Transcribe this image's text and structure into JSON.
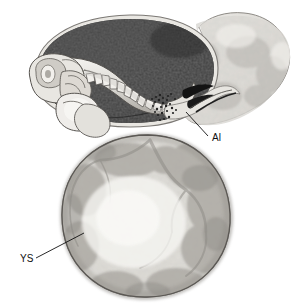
{
  "figure": {
    "kind": "anatomical-illustration",
    "background_color": "#ffffff",
    "width": 295,
    "height": 308
  },
  "labels": [
    {
      "id": "al",
      "text": "Al",
      "meaning": "allantois",
      "text_x": 212,
      "text_y": 141,
      "leader": "M 208 136 L 186 112"
    },
    {
      "id": "ys",
      "text": "YS",
      "meaning": "yolk sac",
      "text_x": 20,
      "text_y": 262,
      "leader": "M 36 258 L 84 233"
    }
  ],
  "structures": {
    "amniotic_cavity": {
      "name": "amniotic cavity",
      "fill": "#3a3a3a"
    },
    "embryo": {
      "name": "embryo",
      "fill": "#d8d5d0"
    },
    "yolk_sac": {
      "name": "yolk sac",
      "fill": "#cfcdc8"
    },
    "chorion": {
      "name": "chorion / trophoblast",
      "fill": "#dcdad6"
    },
    "allantoic_vessels": {
      "name": "allantoic vessels",
      "fill": "#1a1a1a"
    },
    "somites": {
      "name": "somites",
      "fill": "#efeeea"
    },
    "stipple": {
      "name": "stippled junction",
      "fill": "#2a2a2a"
    }
  },
  "palette": {
    "outline": "#4a4745",
    "dark": "#3a3a3a",
    "darkest": "#141414",
    "mid": "#9a9792",
    "light": "#e6e4df",
    "lightest": "#f4f3ef",
    "label": "#111111"
  }
}
